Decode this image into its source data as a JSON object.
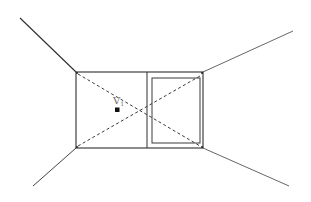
{
  "diagram": {
    "type": "one-point perspective room",
    "vanishing_point": {
      "label": "V",
      "subscript": "1",
      "x": 117,
      "y": 110
    },
    "back_wall": {
      "x1": 76,
      "y1": 72,
      "x2": 203,
      "y2": 148
    },
    "divider_x": 147,
    "window": {
      "x1": 152,
      "y1": 78,
      "x2": 200,
      "y2": 143
    },
    "corner_lines": [
      {
        "name": "top-left",
        "x1": 20,
        "y1": 18,
        "x2": 76,
        "y2": 72
      },
      {
        "name": "top-right",
        "x1": 293,
        "y1": 31,
        "x2": 203,
        "y2": 72
      },
      {
        "name": "bottom-left",
        "x1": 33,
        "y1": 186,
        "x2": 76,
        "y2": 148
      },
      {
        "name": "bottom-right",
        "x1": 289,
        "y1": 186,
        "x2": 203,
        "y2": 148
      }
    ],
    "dashed_diagonals": [
      {
        "x1": 78,
        "y1": 74,
        "x2": 200,
        "y2": 146
      },
      {
        "x1": 78,
        "y1": 146,
        "x2": 200,
        "y2": 76
      }
    ],
    "colors": {
      "line": "#3a3a3a",
      "wall_line": "#2e2e2e",
      "dash": "#3a3a3a",
      "label": "#6a6a6a",
      "background": "#ffffff"
    }
  }
}
